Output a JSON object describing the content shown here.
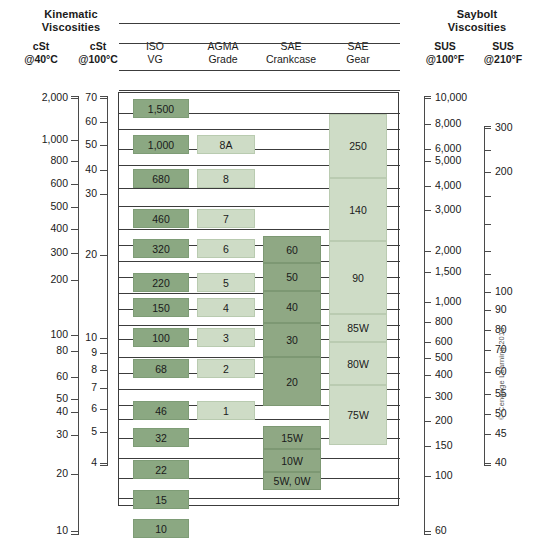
{
  "groups": {
    "kinematic": "Kinematic\nViscosities",
    "kinematic_line1": "Kinematic",
    "kinematic_line2": "Viscosities",
    "saybolt_line1": "Saybolt",
    "saybolt_line2": "Viscosities"
  },
  "columns": [
    {
      "id": "cst40",
      "line1": "cSt",
      "line2": "@40°C",
      "bold": true
    },
    {
      "id": "cst100",
      "line1": "cSt",
      "line2": "@100°C",
      "bold": true
    },
    {
      "id": "isovg",
      "line1": "ISO",
      "line2": "VG",
      "bold": false
    },
    {
      "id": "agma",
      "line1": "AGMA",
      "line2": "Grade",
      "bold": false
    },
    {
      "id": "saecc",
      "line1": "SAE",
      "line2": "Crankcase",
      "bold": false
    },
    {
      "id": "saegear",
      "line1": "SAE",
      "line2": "Gear",
      "bold": false
    },
    {
      "id": "sus100",
      "line1": "SUS",
      "line2": "@100°F",
      "bold": true
    },
    {
      "id": "sus210",
      "line1": "SUS",
      "line2": "@210°F",
      "bold": true
    }
  ],
  "copyright": "© Cengage Learning 2013",
  "colors": {
    "iso_bar": "#8ba882",
    "agma_bar": "#cedcc6",
    "crankcase_bar": "#8fa884",
    "gear_bar": "#cedcc6",
    "line": "#3c3c3c",
    "text": "#1a1a1a"
  },
  "chart_data": {
    "type": "table",
    "axes": [
      {
        "name": "cSt @40°C",
        "side": "left",
        "scale": "log",
        "range": [
          10,
          2000
        ],
        "ticks": [
          2000,
          1000,
          800,
          600,
          500,
          400,
          300,
          200,
          100,
          80,
          60,
          50,
          40,
          30,
          20,
          10
        ],
        "tick_labels": [
          "2,000",
          "1,000",
          "800",
          "600",
          "500",
          "400",
          "300",
          "200",
          "100",
          "80",
          "60",
          "50",
          "40",
          "30",
          "20",
          "10"
        ]
      },
      {
        "name": "cSt @100°C",
        "side": "left",
        "scale": "log",
        "range": [
          4,
          70
        ],
        "ticks": [
          70,
          60,
          50,
          40,
          30,
          20,
          10,
          9,
          8,
          7,
          6,
          5,
          4
        ],
        "tick_labels": [
          "70",
          "60",
          "50",
          "40",
          "30",
          "20",
          "10",
          "9",
          "8",
          "7",
          "6",
          "5",
          "4"
        ]
      },
      {
        "name": "SUS @100°F",
        "side": "right",
        "scale": "log",
        "range": [
          60,
          10000
        ],
        "ticks": [
          10000,
          8000,
          6000,
          5000,
          4000,
          3000,
          2000,
          1500,
          1000,
          800,
          600,
          500,
          400,
          300,
          200,
          150,
          100,
          60
        ],
        "tick_labels": [
          "10,000",
          "8,000",
          "6,000",
          "5,000",
          "4,000",
          "3,000",
          "2,000",
          "1,500",
          "1,000",
          "800",
          "600",
          "500",
          "400",
          "300",
          "200",
          "150",
          "100",
          "60"
        ]
      },
      {
        "name": "SUS @210°F",
        "side": "right",
        "scale": "log",
        "range": [
          40,
          300
        ],
        "ticks": [
          300,
          200,
          100,
          90,
          80,
          70,
          60,
          55,
          50,
          45,
          40
        ],
        "tick_labels": [
          "300",
          "200",
          "100",
          "90",
          "80",
          "70",
          "60",
          "55",
          "50",
          "45",
          "40"
        ]
      }
    ],
    "series": [
      {
        "name": "ISO VG",
        "style": "separate-blocks",
        "color": "#8ba882",
        "values": [
          "1,500",
          "1,000",
          "680",
          "460",
          "320",
          "220",
          "150",
          "100",
          "68",
          "46",
          "32",
          "22",
          "15",
          "10"
        ]
      },
      {
        "name": "AGMA Grade",
        "style": "separate-blocks",
        "color": "#cedcc6",
        "values": [
          "8A",
          "8",
          "7",
          "6",
          "5",
          "4",
          "3",
          "2",
          "1"
        ]
      },
      {
        "name": "SAE Crankcase",
        "style": "stacked-column",
        "color": "#8fa884",
        "values": [
          "60",
          "50",
          "40",
          "30",
          "20",
          "15W",
          "10W",
          "5W, 0W"
        ]
      },
      {
        "name": "SAE Gear",
        "style": "stacked-column",
        "color": "#cedcc6",
        "values": [
          "250",
          "140",
          "90",
          "85W",
          "80W",
          "75W"
        ]
      }
    ],
    "gridlines": 28,
    "legend": "none"
  },
  "layout": {
    "plot": {
      "left": 118,
      "top": 92,
      "width": 281,
      "height": 414
    },
    "gridlines_y": [
      22,
      42,
      69,
      89,
      112,
      128,
      148,
      164,
      187,
      205,
      228,
      244,
      260,
      276,
      292,
      308,
      324,
      338,
      356,
      372,
      388,
      404,
      418,
      437,
      457,
      477,
      497
    ],
    "axis_cst40": {
      "x": 78,
      "top": 96,
      "bottom": 535,
      "ticks": [
        {
          "v": "2,000",
          "y": 98
        },
        {
          "v": "1,000",
          "y": 140
        },
        {
          "v": "800",
          "y": 161
        },
        {
          "v": "600",
          "y": 184
        },
        {
          "v": "500",
          "y": 207
        },
        {
          "v": "400",
          "y": 229
        },
        {
          "v": "300",
          "y": 253
        },
        {
          "v": "200",
          "y": 280
        },
        {
          "v": "100",
          "y": 335
        },
        {
          "v": "80",
          "y": 351
        },
        {
          "v": "60",
          "y": 377
        },
        {
          "v": "50",
          "y": 399
        },
        {
          "v": "40",
          "y": 412
        },
        {
          "v": "30",
          "y": 435
        },
        {
          "v": "20",
          "y": 474
        },
        {
          "v": "10",
          "y": 531
        }
      ]
    },
    "axis_cst100": {
      "x": 107,
      "top": 96,
      "bottom": 466,
      "ticks": [
        {
          "v": "70",
          "y": 98
        },
        {
          "v": "60",
          "y": 122
        },
        {
          "v": "50",
          "y": 145
        },
        {
          "v": "40",
          "y": 170
        },
        {
          "v": "30",
          "y": 194
        },
        {
          "v": "20",
          "y": 255
        },
        {
          "v": "10",
          "y": 338
        },
        {
          "v": "9",
          "y": 353
        },
        {
          "v": "8",
          "y": 370
        },
        {
          "v": "7",
          "y": 388
        },
        {
          "v": "6",
          "y": 409
        },
        {
          "v": "5",
          "y": 432
        },
        {
          "v": "4",
          "y": 463
        }
      ]
    },
    "axis_sus100": {
      "x": 424,
      "top": 96,
      "bottom": 535,
      "ticks": [
        {
          "v": "10,000",
          "y": 98
        },
        {
          "v": "8,000",
          "y": 124
        },
        {
          "v": "6,000",
          "y": 149
        },
        {
          "v": "5,000",
          "y": 161
        },
        {
          "v": "4,000",
          "y": 186
        },
        {
          "v": "3,000",
          "y": 210
        },
        {
          "v": "2,000",
          "y": 251
        },
        {
          "v": "1,500",
          "y": 272
        },
        {
          "v": "1,000",
          "y": 302
        },
        {
          "v": "800",
          "y": 322
        },
        {
          "v": "600",
          "y": 342
        },
        {
          "v": "500",
          "y": 358
        },
        {
          "v": "400",
          "y": 375
        },
        {
          "v": "300",
          "y": 397
        },
        {
          "v": "200",
          "y": 421
        },
        {
          "v": "150",
          "y": 446
        },
        {
          "v": "100",
          "y": 476
        },
        {
          "v": "60",
          "y": 531
        }
      ]
    },
    "axis_sus210": {
      "x": 484,
      "top": 126,
      "bottom": 466,
      "ticks": [
        {
          "v": "300",
          "y": 128
        },
        {
          "v": "",
          "y": 150
        },
        {
          "v": "200",
          "y": 172
        },
        {
          "v": "",
          "y": 196
        },
        {
          "v": "",
          "y": 224
        },
        {
          "v": "",
          "y": 251
        },
        {
          "v": "",
          "y": 274
        },
        {
          "v": "100",
          "y": 292
        },
        {
          "v": "90",
          "y": 310
        },
        {
          "v": "80",
          "y": 330
        },
        {
          "v": "70",
          "y": 350
        },
        {
          "v": "60",
          "y": 372
        },
        {
          "v": "55",
          "y": 394
        },
        {
          "v": "50",
          "y": 414
        },
        {
          "v": "45",
          "y": 434
        },
        {
          "v": "40",
          "y": 463
        }
      ]
    },
    "iso_bars": [
      {
        "label": "1,500",
        "y": 98,
        "h": 19
      },
      {
        "label": "1,000",
        "y": 134,
        "h": 19
      },
      {
        "label": "680",
        "y": 168,
        "h": 19
      },
      {
        "label": "460",
        "y": 208,
        "h": 19
      },
      {
        "label": "320",
        "y": 238,
        "h": 19
      },
      {
        "label": "220",
        "y": 272,
        "h": 19
      },
      {
        "label": "150",
        "y": 297,
        "h": 19
      },
      {
        "label": "100",
        "y": 327,
        "h": 19
      },
      {
        "label": "68",
        "y": 358,
        "h": 19
      },
      {
        "label": "46",
        "y": 400,
        "h": 19
      },
      {
        "label": "32",
        "y": 427,
        "h": 19
      },
      {
        "label": "22",
        "y": 459,
        "h": 19
      },
      {
        "label": "15",
        "y": 489,
        "h": 19
      },
      {
        "label": "10",
        "y": 518,
        "h": 19
      }
    ],
    "agma_bars": [
      {
        "label": "8A",
        "y": 134,
        "h": 19
      },
      {
        "label": "8",
        "y": 168,
        "h": 19
      },
      {
        "label": "7",
        "y": 208,
        "h": 19
      },
      {
        "label": "6",
        "y": 238,
        "h": 19
      },
      {
        "label": "5",
        "y": 272,
        "h": 19
      },
      {
        "label": "4",
        "y": 297,
        "h": 19
      },
      {
        "label": "3",
        "y": 327,
        "h": 19
      },
      {
        "label": "2",
        "y": 358,
        "h": 19
      },
      {
        "label": "1",
        "y": 400,
        "h": 19
      }
    ],
    "crank_bars": [
      {
        "label": "60",
        "y": 235,
        "h": 27
      },
      {
        "label": "50",
        "y": 262,
        "h": 28
      },
      {
        "label": "40",
        "y": 290,
        "h": 32
      },
      {
        "label": "30",
        "y": 322,
        "h": 34
      },
      {
        "label": "20",
        "y": 356,
        "h": 49
      },
      {
        "label": "15W",
        "y": 425,
        "h": 23
      },
      {
        "label": "10W",
        "y": 448,
        "h": 23
      },
      {
        "label": "5W, 0W",
        "y": 471,
        "h": 18
      }
    ],
    "gear_bars": [
      {
        "label": "250",
        "y": 113,
        "h": 64
      },
      {
        "label": "140",
        "y": 177,
        "h": 63
      },
      {
        "label": "90",
        "y": 240,
        "h": 73
      },
      {
        "label": "85W",
        "y": 313,
        "h": 28
      },
      {
        "label": "80W",
        "y": 341,
        "h": 43
      },
      {
        "label": "75W",
        "y": 384,
        "h": 60
      }
    ],
    "col_heads": [
      {
        "key": 0,
        "left": 10,
        "top": 40,
        "width": 62,
        "bold": true
      },
      {
        "key": 1,
        "left": 62,
        "top": 40,
        "width": 72,
        "bold": true
      },
      {
        "key": 2,
        "left": 128,
        "top": 40,
        "width": 54,
        "bold": false
      },
      {
        "key": 3,
        "left": 192,
        "top": 40,
        "width": 62,
        "bold": false
      },
      {
        "key": 4,
        "left": 250,
        "top": 40,
        "width": 82,
        "bold": false
      },
      {
        "key": 5,
        "left": 330,
        "top": 40,
        "width": 56,
        "bold": false
      },
      {
        "key": 6,
        "left": 414,
        "top": 40,
        "width": 62,
        "bold": true
      },
      {
        "key": 7,
        "left": 472,
        "top": 40,
        "width": 62,
        "bold": true
      }
    ]
  }
}
